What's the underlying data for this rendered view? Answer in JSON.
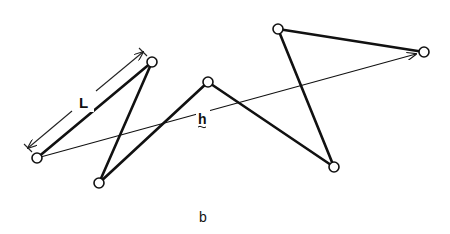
{
  "figure": {
    "caption": "b",
    "segment_label": "L",
    "vector_label": "h",
    "colors": {
      "ink": "#111111",
      "background": "#ffffff"
    }
  },
  "chain": {
    "nodes": [
      {
        "id": 1,
        "x": 37,
        "y": 158
      },
      {
        "id": 2,
        "x": 152,
        "y": 62
      },
      {
        "id": 3,
        "x": 99,
        "y": 183
      },
      {
        "id": 4,
        "x": 208,
        "y": 82
      },
      {
        "id": 5,
        "x": 334,
        "y": 167
      },
      {
        "id": 6,
        "x": 278,
        "y": 29
      },
      {
        "id": 7,
        "x": 424,
        "y": 52
      }
    ],
    "bonds": [
      [
        1,
        2
      ],
      [
        2,
        3
      ],
      [
        3,
        4
      ],
      [
        4,
        5
      ],
      [
        5,
        6
      ],
      [
        6,
        7
      ]
    ],
    "end_to_end_vector": {
      "from": 1,
      "to": 7
    }
  }
}
